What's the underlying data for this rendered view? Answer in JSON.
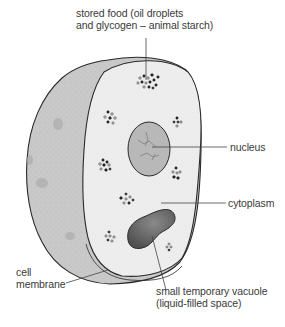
{
  "diagram": {
    "labels": {
      "stored_food": {
        "line1": "stored food (oil droplets",
        "line2": "and glycogen – animal starch)"
      },
      "nucleus": "nucleus",
      "cytoplasm": "cytoplasm",
      "cell_membrane": {
        "line1": "cell",
        "line2": "membrane"
      },
      "vacuole": {
        "line1": "small temporary vacuole",
        "line2": "(liquid-filled space)"
      }
    },
    "colors": {
      "outer_shell": "#c9c9c9",
      "cut_face": "#eeeeee",
      "nucleus": "#b8b8b8",
      "vacuole": "#6f6f6f",
      "outline": "#2a2a2a",
      "leader_line": "#444444",
      "text": "#3a3a3a"
    }
  }
}
